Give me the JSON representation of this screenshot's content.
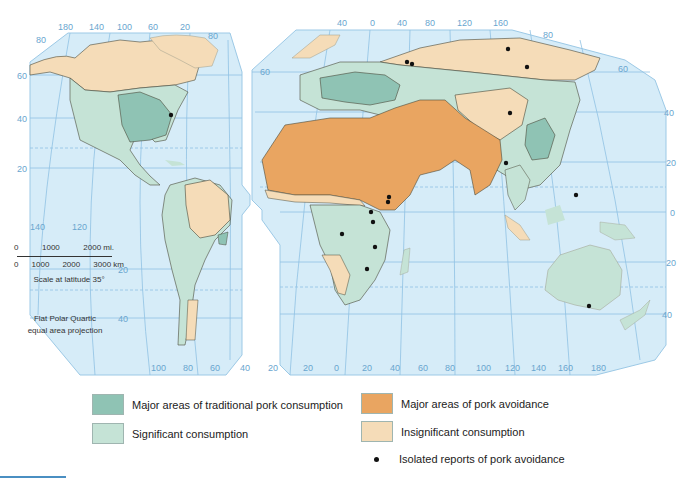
{
  "map": {
    "projection": "Flat Polar Quartic equal area projection",
    "projection_line1": "Flat Polar Quartic",
    "projection_line2": "equal area projection",
    "colors": {
      "ocean": "#d6ecf8",
      "graticule": "#8fc2e3",
      "border": "#4a4a3a",
      "traditional": "#8fc3b4",
      "significant": "#c5e3d6",
      "avoidance": "#e9a561",
      "insignificant": "#f5dcb8",
      "dot": "#111111"
    },
    "left_panel": {
      "top_longitudes": [
        "180",
        "140",
        "100",
        "60",
        "20"
      ],
      "top_corner_latitude": "80",
      "left_latitudes": [
        "60",
        "40",
        "20"
      ],
      "inner_longitudes": [
        "140",
        "120"
      ],
      "right_latitudes": [
        "20",
        "40"
      ],
      "bottom_longitudes": [
        "100",
        "80",
        "60",
        "40",
        "20"
      ]
    },
    "right_panel": {
      "top_longitudes": [
        "40",
        "0",
        "40",
        "80",
        "120",
        "160"
      ],
      "top_corner_latitude": "80",
      "left_latitude": "60",
      "right_latitudes": [
        "60",
        "40",
        "20",
        "0",
        "20",
        "40"
      ],
      "bottom_longitudes": [
        "20",
        "0",
        "20",
        "40",
        "60",
        "80",
        "100",
        "120",
        "140",
        "160",
        "180"
      ]
    }
  },
  "scale": {
    "mi_labels": [
      "0",
      "1000",
      "2000 mi."
    ],
    "km_labels": [
      "0",
      "1000",
      "2000",
      "3000 km"
    ],
    "caption": "Scale at latitude 35°"
  },
  "legend": {
    "items": [
      {
        "label": "Major areas of traditional pork consumption",
        "color": "#8fc3b4"
      },
      {
        "label": "Significant consumption",
        "color": "#c5e3d6"
      },
      {
        "label": "Major areas of pork avoidance",
        "color": "#e9a561"
      },
      {
        "label": "Insignificant consumption",
        "color": "#f5dcb8"
      }
    ],
    "dot_label": "Isolated reports of pork avoidance"
  }
}
